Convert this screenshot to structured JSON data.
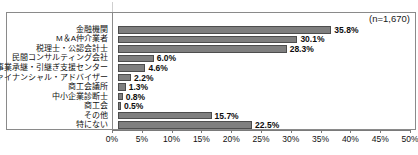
{
  "annotation": {
    "sample_size": "(n=1,670)"
  },
  "title_remnant": "",
  "chart_data": {
    "type": "bar",
    "orientation": "horizontal",
    "title": "",
    "subtitle": "",
    "xlabel": "",
    "ylabel": "",
    "xlim": [
      0,
      50
    ],
    "grid": false,
    "legend": null,
    "annotations": [
      "(n=1,670)"
    ],
    "tick_labels": [
      "0%",
      "5%",
      "10%",
      "15%",
      "20%",
      "25%",
      "30%",
      "35%",
      "40%",
      "45%",
      "50%"
    ],
    "tick_values": [
      0,
      5,
      10,
      15,
      20,
      25,
      30,
      35,
      40,
      45,
      50
    ],
    "categories": [
      "金融機関",
      "M＆A仲介業者",
      "税理士・公認会計士",
      "民間コンサルティング会社",
      "事業承継・引継ぎ支援センター",
      "ファイナンシャル・アドバイザー",
      "商工会議所",
      "中小企業診断士",
      "商工会",
      "その他",
      "特にない"
    ],
    "values": [
      35.8,
      30.1,
      28.3,
      6.0,
      4.6,
      2.2,
      1.3,
      0.8,
      0.5,
      15.7,
      22.5
    ],
    "value_labels": [
      "35.8%",
      "30.1%",
      "28.3%",
      "6.0%",
      "4.6%",
      "2.2%",
      "1.3%",
      "0.8%",
      "0.5%",
      "15.7%",
      "22.5%"
    ],
    "colors": {
      "bar_fill": "#7f7f7f",
      "bar_stroke": "#4d4d4d",
      "axis": "#7a7a7a",
      "frame": "#8a8a8a",
      "text": "#111111",
      "background": "#ffffff"
    }
  }
}
